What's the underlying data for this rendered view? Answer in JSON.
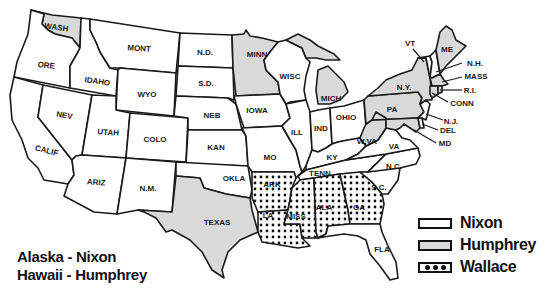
{
  "colors": {
    "nixon": "#ffffff",
    "humphrey": "#d9d9d9",
    "wallace_bg": "#ffffff",
    "wallace_dot": "#111111",
    "outline": "#1a1a1a"
  },
  "legend": {
    "items": [
      {
        "candidate": "nixon",
        "label": "Nixon",
        "pattern": "blank"
      },
      {
        "candidate": "humphrey",
        "label": "Humphrey",
        "pattern": "gray"
      },
      {
        "candidate": "wallace",
        "label": "Wallace",
        "pattern": "dots"
      }
    ]
  },
  "notes": {
    "alaska": "Alaska - Nixon",
    "hawaii": "Hawaii - Humphrey"
  },
  "states": [
    {
      "abbr": "WASH",
      "winner": "humphrey"
    },
    {
      "abbr": "ORE",
      "winner": "nixon"
    },
    {
      "abbr": "CALIF",
      "winner": "nixon"
    },
    {
      "abbr": "IDAHO",
      "winner": "nixon"
    },
    {
      "abbr": "NEV",
      "winner": "nixon"
    },
    {
      "abbr": "MONT",
      "winner": "nixon"
    },
    {
      "abbr": "WYO",
      "winner": "nixon"
    },
    {
      "abbr": "UTAH",
      "winner": "nixon"
    },
    {
      "abbr": "COLO",
      "winner": "nixon"
    },
    {
      "abbr": "ARIZ",
      "winner": "nixon"
    },
    {
      "abbr": "N.M.",
      "winner": "nixon"
    },
    {
      "abbr": "N.D.",
      "winner": "nixon"
    },
    {
      "abbr": "S.D.",
      "winner": "nixon"
    },
    {
      "abbr": "NEB",
      "winner": "nixon"
    },
    {
      "abbr": "KAN",
      "winner": "nixon"
    },
    {
      "abbr": "OKLA",
      "winner": "nixon"
    },
    {
      "abbr": "TEXAS",
      "winner": "humphrey"
    },
    {
      "abbr": "MINN",
      "winner": "humphrey"
    },
    {
      "abbr": "IOWA",
      "winner": "nixon"
    },
    {
      "abbr": "MO",
      "winner": "nixon"
    },
    {
      "abbr": "ARK",
      "winner": "wallace"
    },
    {
      "abbr": "LA",
      "winner": "wallace"
    },
    {
      "abbr": "WISC",
      "winner": "nixon"
    },
    {
      "abbr": "ILL",
      "winner": "nixon"
    },
    {
      "abbr": "MICH",
      "winner": "humphrey"
    },
    {
      "abbr": "IND",
      "winner": "nixon"
    },
    {
      "abbr": "OHIO",
      "winner": "nixon"
    },
    {
      "abbr": "KY",
      "winner": "nixon"
    },
    {
      "abbr": "TENN",
      "winner": "nixon"
    },
    {
      "abbr": "MISS",
      "winner": "wallace"
    },
    {
      "abbr": "ALA",
      "winner": "wallace"
    },
    {
      "abbr": "GA",
      "winner": "wallace"
    },
    {
      "abbr": "FLA",
      "winner": "nixon"
    },
    {
      "abbr": "S.C.",
      "winner": "nixon"
    },
    {
      "abbr": "N.C.",
      "winner": "nixon"
    },
    {
      "abbr": "VA",
      "winner": "nixon"
    },
    {
      "abbr": "W.VA",
      "winner": "humphrey"
    },
    {
      "abbr": "PA",
      "winner": "humphrey"
    },
    {
      "abbr": "N.Y.",
      "winner": "humphrey"
    },
    {
      "abbr": "VT",
      "winner": "nixon"
    },
    {
      "abbr": "N.H.",
      "winner": "nixon"
    },
    {
      "abbr": "ME",
      "winner": "humphrey"
    },
    {
      "abbr": "MASS",
      "winner": "humphrey"
    },
    {
      "abbr": "R.I.",
      "winner": "humphrey"
    },
    {
      "abbr": "CONN",
      "winner": "humphrey"
    },
    {
      "abbr": "N.J.",
      "winner": "nixon"
    },
    {
      "abbr": "DEL",
      "winner": "nixon"
    },
    {
      "abbr": "MD",
      "winner": "humphrey"
    }
  ]
}
